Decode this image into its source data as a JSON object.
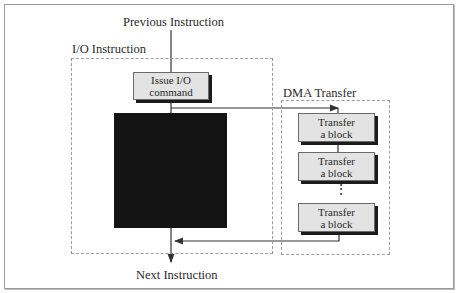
{
  "diagram": {
    "top_label": "Previous Instruction",
    "bottom_label": "Next Instruction",
    "io_group": {
      "label": "I/O Instruction",
      "issue_box": {
        "line1": "Issue I/O",
        "line2": "command"
      },
      "blocked_region": "redacted-black-box"
    },
    "dma_group": {
      "label": "DMA Transfer",
      "blocks": [
        {
          "line1": "Transfer",
          "line2": "a block"
        },
        {
          "line1": "Transfer",
          "line2": "a block"
        },
        {
          "line1": "Transfer",
          "line2": "a block"
        }
      ],
      "ellipsis": "⋮"
    },
    "colors": {
      "box_fill": "#e3e3e3",
      "shadow": "#1c1c1c",
      "dashed": "#9c9c9c",
      "line": "#333333"
    }
  }
}
